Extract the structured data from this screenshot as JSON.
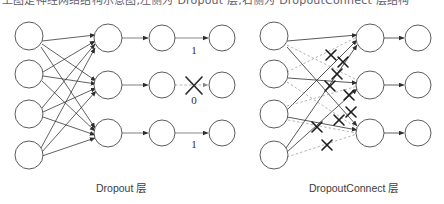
{
  "figure": {
    "title_fragment": "上图是神经网络结构示意图,左侧为 Dropout 层,右侧为 DropoutConnect 层结构",
    "background_color": "#ffffff",
    "stroke_color": "#3c3c3c",
    "node_fill": "#ffffff",
    "dashed_color": "#9a9a9a",
    "width": 444,
    "height": 204
  },
  "panels": [
    {
      "id": "dropout",
      "caption": "Dropout 层",
      "caption_x": 96,
      "caption_y": 180,
      "layers": [
        {
          "name": "input-layer",
          "x": 29,
          "count": 4,
          "ys": [
            36,
            74,
            114,
            155
          ],
          "r": 14
        },
        {
          "name": "hidden-layer",
          "x": 108,
          "count": 3,
          "ys": [
            38,
            85,
            133
          ],
          "r": 14
        },
        {
          "name": "mask-layer",
          "x": 162,
          "count": 3,
          "ys": [
            38,
            85,
            133
          ],
          "r": 13
        },
        {
          "name": "output-layer",
          "x": 222,
          "count": 3,
          "ys": [
            38,
            85,
            133
          ],
          "r": 13
        }
      ],
      "mask_labels": [
        {
          "value": "1",
          "x": 194,
          "y": 54,
          "crossed": false
        },
        {
          "value": "0",
          "x": 194,
          "y": 104,
          "crossed": true
        },
        {
          "value": "1",
          "x": 194,
          "y": 148,
          "crossed": false
        }
      ],
      "dense_connections": [
        [
          0,
          0
        ],
        [
          0,
          1
        ],
        [
          0,
          2
        ],
        [
          1,
          0
        ],
        [
          1,
          1
        ],
        [
          1,
          2
        ],
        [
          2,
          0
        ],
        [
          2,
          1
        ],
        [
          2,
          2
        ],
        [
          3,
          0
        ],
        [
          3,
          1
        ],
        [
          3,
          2
        ]
      ],
      "dropped_unit_index": 1
    },
    {
      "id": "dropconnect",
      "caption": "DropoutConnect 层",
      "caption_x": 309,
      "caption_y": 180,
      "layers": [
        {
          "name": "input-layer",
          "x": 274,
          "count": 4,
          "ys": [
            36,
            74,
            114,
            155
          ],
          "r": 14
        },
        {
          "name": "hidden-layer",
          "x": 370,
          "count": 3,
          "ys": [
            38,
            85,
            133
          ],
          "r": 14
        },
        {
          "name": "output-layer",
          "x": 418,
          "count": 3,
          "ys": [
            38,
            85,
            133
          ],
          "r": 13
        }
      ],
      "dense_connections": [
        {
          "from": 0,
          "to": 0,
          "dropped": false
        },
        {
          "from": 0,
          "to": 1,
          "dropped": true
        },
        {
          "from": 0,
          "to": 2,
          "dropped": true
        },
        {
          "from": 1,
          "to": 0,
          "dropped": true
        },
        {
          "from": 1,
          "to": 1,
          "dropped": false
        },
        {
          "from": 1,
          "to": 2,
          "dropped": true
        },
        {
          "from": 2,
          "to": 0,
          "dropped": false
        },
        {
          "from": 2,
          "to": 1,
          "dropped": true
        },
        {
          "from": 2,
          "to": 2,
          "dropped": false
        },
        {
          "from": 3,
          "to": 0,
          "dropped": false
        },
        {
          "from": 3,
          "to": 1,
          "dropped": false
        },
        {
          "from": 3,
          "to": 2,
          "dropped": true
        }
      ],
      "cross_marks": [
        {
          "x": 331,
          "y": 55
        },
        {
          "x": 343,
          "y": 62
        },
        {
          "x": 337,
          "y": 74
        },
        {
          "x": 330,
          "y": 86
        },
        {
          "x": 349,
          "y": 95
        },
        {
          "x": 351,
          "y": 112
        },
        {
          "x": 339,
          "y": 120
        },
        {
          "x": 317,
          "y": 127
        },
        {
          "x": 327,
          "y": 145
        }
      ]
    }
  ]
}
